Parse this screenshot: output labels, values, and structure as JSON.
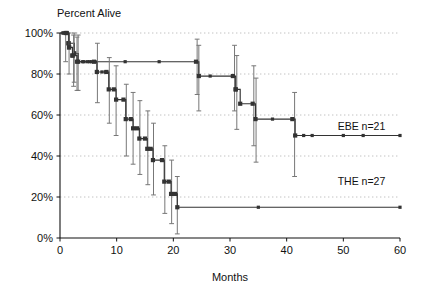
{
  "chart_data": {
    "type": "line",
    "subtype": "kaplan-meier-survival-step",
    "title": "Percent Alive",
    "xlabel": "Months",
    "ylabel": "",
    "xlim": [
      0,
      60
    ],
    "ylim": [
      0,
      100
    ],
    "xticks": [
      0,
      10,
      20,
      30,
      40,
      50,
      60
    ],
    "xticklabels": [
      "0",
      "10",
      "20",
      "30",
      "40",
      "50",
      "60"
    ],
    "yticks": [
      0,
      20,
      40,
      60,
      80,
      100
    ],
    "yticklabels": [
      "0%",
      "20%",
      "40%",
      "60%",
      "80%",
      "100%"
    ],
    "grid": "horizontal-dotted",
    "grid_color": "#bbbbbb",
    "legend_position": "inline-right",
    "line_color": "#333333",
    "errorbar_color": "#777777",
    "series": [
      {
        "name": "EBE",
        "label": "EBE  n=21",
        "n": 21,
        "annotation_x": 49,
        "annotation_y": 52.5,
        "steps": [
          {
            "x": 0,
            "y": 100
          },
          {
            "x": 1,
            "y": 100
          },
          {
            "x": 1.5,
            "y": 95
          },
          {
            "x": 2.5,
            "y": 90
          },
          {
            "x": 3.2,
            "y": 86
          },
          {
            "x": 24,
            "y": 86
          },
          {
            "x": 24.5,
            "y": 79
          },
          {
            "x": 30.5,
            "y": 79
          },
          {
            "x": 31,
            "y": 72.5
          },
          {
            "x": 31.8,
            "y": 65.5
          },
          {
            "x": 34,
            "y": 65.5
          },
          {
            "x": 34.5,
            "y": 58
          },
          {
            "x": 41,
            "y": 58
          },
          {
            "x": 41.5,
            "y": 50
          },
          {
            "x": 60,
            "y": 50
          }
        ],
        "censor_marks": [
          {
            "x": 0.5,
            "y": 100
          },
          {
            "x": 1.0,
            "y": 100
          },
          {
            "x": 4.2,
            "y": 86
          },
          {
            "x": 5.2,
            "y": 86
          },
          {
            "x": 6.2,
            "y": 86
          },
          {
            "x": 11.5,
            "y": 86
          },
          {
            "x": 17.5,
            "y": 86
          },
          {
            "x": 26.5,
            "y": 79
          },
          {
            "x": 37.5,
            "y": 58
          },
          {
            "x": 43,
            "y": 50
          },
          {
            "x": 44.5,
            "y": 50
          },
          {
            "x": 50,
            "y": 50
          },
          {
            "x": 53.5,
            "y": 50
          },
          {
            "x": 60,
            "y": 50
          }
        ],
        "error_bars": [
          {
            "x": 1.0,
            "y": 100,
            "lo": 86,
            "hi": 100
          },
          {
            "x": 2.5,
            "y": 89,
            "lo": 76,
            "hi": 100
          },
          {
            "x": 3.2,
            "y": 86,
            "lo": 72,
            "hi": 99
          },
          {
            "x": 24.2,
            "y": 86,
            "lo": 70,
            "hi": 97
          },
          {
            "x": 24.5,
            "y": 79,
            "lo": 62,
            "hi": 94
          },
          {
            "x": 30.8,
            "y": 79,
            "lo": 62,
            "hi": 94
          },
          {
            "x": 31.2,
            "y": 72.5,
            "lo": 53,
            "hi": 89
          },
          {
            "x": 34.2,
            "y": 65.5,
            "lo": 45,
            "hi": 84
          },
          {
            "x": 34.6,
            "y": 58,
            "lo": 37,
            "hi": 78
          },
          {
            "x": 41.4,
            "y": 50,
            "lo": 30,
            "hi": 71
          }
        ]
      },
      {
        "name": "THE",
        "label": "THE  n=27",
        "n": 27,
        "annotation_x": 49,
        "annotation_y": 26,
        "steps": [
          {
            "x": 0,
            "y": 100
          },
          {
            "x": 1.2,
            "y": 100
          },
          {
            "x": 1.6,
            "y": 93
          },
          {
            "x": 2.2,
            "y": 89
          },
          {
            "x": 3.0,
            "y": 86
          },
          {
            "x": 6.0,
            "y": 86
          },
          {
            "x": 6.5,
            "y": 81
          },
          {
            "x": 8.2,
            "y": 81
          },
          {
            "x": 8.6,
            "y": 72.5
          },
          {
            "x": 9.5,
            "y": 72.5
          },
          {
            "x": 9.9,
            "y": 67.5
          },
          {
            "x": 11.2,
            "y": 67.5
          },
          {
            "x": 11.6,
            "y": 58
          },
          {
            "x": 12.5,
            "y": 58
          },
          {
            "x": 12.9,
            "y": 53.5
          },
          {
            "x": 13.6,
            "y": 53.5
          },
          {
            "x": 14.0,
            "y": 48.5
          },
          {
            "x": 15.0,
            "y": 48.5
          },
          {
            "x": 15.4,
            "y": 43.5
          },
          {
            "x": 16.0,
            "y": 43.5
          },
          {
            "x": 16.4,
            "y": 38
          },
          {
            "x": 18.0,
            "y": 38
          },
          {
            "x": 18.4,
            "y": 27.5
          },
          {
            "x": 19.2,
            "y": 27.5
          },
          {
            "x": 19.6,
            "y": 21.5
          },
          {
            "x": 20.3,
            "y": 21.5
          },
          {
            "x": 20.7,
            "y": 15
          },
          {
            "x": 60,
            "y": 15
          }
        ],
        "censor_marks": [
          {
            "x": 0.6,
            "y": 100
          },
          {
            "x": 4.0,
            "y": 86
          },
          {
            "x": 4.8,
            "y": 86
          },
          {
            "x": 5.6,
            "y": 86
          },
          {
            "x": 7.4,
            "y": 81
          },
          {
            "x": 8.0,
            "y": 81
          },
          {
            "x": 35,
            "y": 15
          },
          {
            "x": 60,
            "y": 15
          }
        ],
        "error_bars": [
          {
            "x": 1.6,
            "y": 93,
            "lo": 80,
            "hi": 100
          },
          {
            "x": 2.4,
            "y": 88,
            "lo": 74,
            "hi": 99
          },
          {
            "x": 3.0,
            "y": 86,
            "lo": 72,
            "hi": 98
          },
          {
            "x": 6.6,
            "y": 81,
            "lo": 66,
            "hi": 95
          },
          {
            "x": 8.7,
            "y": 72.5,
            "lo": 56,
            "hi": 88
          },
          {
            "x": 9.9,
            "y": 67.5,
            "lo": 50,
            "hi": 84
          },
          {
            "x": 11.7,
            "y": 58,
            "lo": 40,
            "hi": 75
          },
          {
            "x": 12.9,
            "y": 53.5,
            "lo": 36,
            "hi": 71
          },
          {
            "x": 14.1,
            "y": 48.5,
            "lo": 31,
            "hi": 67
          },
          {
            "x": 15.5,
            "y": 43.5,
            "lo": 26,
            "hi": 62
          },
          {
            "x": 16.5,
            "y": 38,
            "lo": 21,
            "hi": 56
          },
          {
            "x": 18.5,
            "y": 27.5,
            "lo": 12,
            "hi": 45
          },
          {
            "x": 19.7,
            "y": 21.5,
            "lo": 7,
            "hi": 38
          },
          {
            "x": 20.7,
            "y": 15,
            "lo": 2,
            "hi": 30
          }
        ]
      }
    ]
  }
}
